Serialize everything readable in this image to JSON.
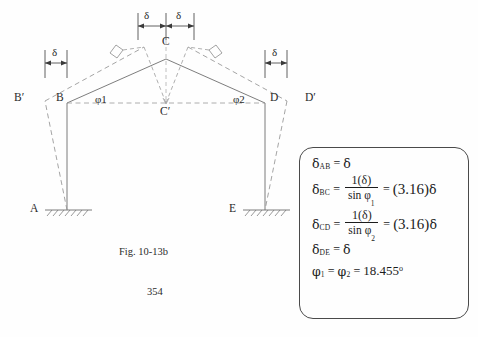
{
  "figure": {
    "caption": "Fig. 10-13b",
    "page_number": "354",
    "dimension_labels": {
      "top_left": "δ",
      "top_right": "δ",
      "side_left": "δ",
      "side_right": "δ"
    },
    "point_labels": {
      "a": "A",
      "b": "B",
      "b_prime": "Bʹ",
      "c": "C",
      "c_prime": "Cʹ",
      "d": "D",
      "d_prime": "Dʹ",
      "e": "E"
    },
    "angle_labels": {
      "phi1": "φ1",
      "phi2": "φ2"
    }
  },
  "equations": {
    "ab": {
      "symbol": "δ",
      "subscript": "AB",
      "equals": "=",
      "rhs": "δ"
    },
    "bc": {
      "symbol": "δ",
      "subscript": "BC",
      "equals": "=",
      "numerator": "1(δ)",
      "denominator": "sin φ",
      "denominator_sub": "1",
      "equals2": "=",
      "result_coeff": "(3.16)",
      "result_sym": "δ"
    },
    "cd": {
      "symbol": "δ",
      "subscript": "CD",
      "equals": "=",
      "numerator": "1(δ)",
      "denominator": "sin φ",
      "denominator_sub": "2",
      "equals2": "=",
      "result_coeff": "(3.16)",
      "result_sym": "δ"
    },
    "de": {
      "symbol": "δ",
      "subscript": "DE",
      "equals": "=",
      "rhs": "δ"
    },
    "angles": {
      "phi1": "φ",
      "phi1_sub": "1",
      "equals": "=",
      "phi2": "φ",
      "phi2_sub": "2",
      "equals2": "=",
      "value": "18.455",
      "degree": "o"
    }
  },
  "colors": {
    "line_solid": "#6e6e6e",
    "line_dashed": "#9a9a9a",
    "text": "#1c1c1c",
    "box_border": "#4a4a4a"
  }
}
